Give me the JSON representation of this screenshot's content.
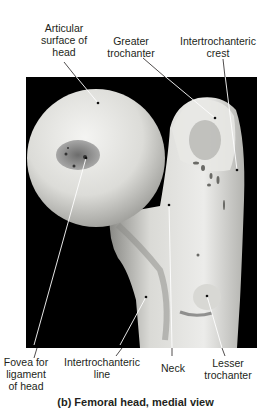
{
  "figure": {
    "caption": "(b) Femoral head, medial view",
    "background_color": "#000000",
    "bone_color": "#e6e6e2",
    "line_color": "#ffffff",
    "labels": {
      "articular_surface": [
        "Articular",
        "surface of",
        "head"
      ],
      "greater_trochanter": [
        "Greater",
        "trochanter"
      ],
      "intertrochanteric_crest": [
        "Intertrochanteric",
        "crest"
      ],
      "fovea": [
        "Fovea for",
        "ligament",
        "of head"
      ],
      "intertrochanteric_line": [
        "Intertrochanteric",
        "line"
      ],
      "neck": [
        "Neck"
      ],
      "lesser_trochanter": [
        "Lesser",
        "trochanter"
      ]
    }
  }
}
